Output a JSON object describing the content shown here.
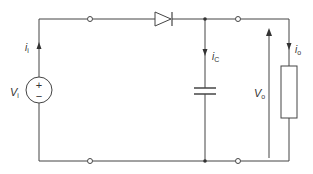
{
  "diagram": {
    "type": "circuit",
    "title": "",
    "components": [
      {
        "id": "source",
        "kind": "voltage-source",
        "label": "V",
        "sub": "i",
        "plus": "+",
        "minus": "−"
      },
      {
        "id": "diode",
        "kind": "diode"
      },
      {
        "id": "capacitor",
        "kind": "capacitor"
      },
      {
        "id": "load",
        "kind": "resistor"
      }
    ],
    "labels": {
      "input_current": {
        "main": "i",
        "sub": "i"
      },
      "cap_current": {
        "main": "i",
        "sub": "C"
      },
      "output_current": {
        "main": "i",
        "sub": "o"
      },
      "input_voltage": {
        "main": "V",
        "sub": "i"
      },
      "output_voltage": {
        "main": "V",
        "sub": "o"
      }
    },
    "colors": {
      "wire": "#444444",
      "background": "#ffffff"
    }
  }
}
